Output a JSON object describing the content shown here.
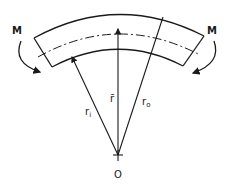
{
  "diagram": {
    "labels": {
      "moment_left": "M",
      "moment_right": "M",
      "inner_radius": "r",
      "inner_radius_sub": "i",
      "centroid_radius": "r̄",
      "outer_radius": "r",
      "outer_radius_sub": "o",
      "center": "O"
    },
    "colors": {
      "stroke": "#1a1a1a",
      "background": "#ffffff"
    }
  }
}
